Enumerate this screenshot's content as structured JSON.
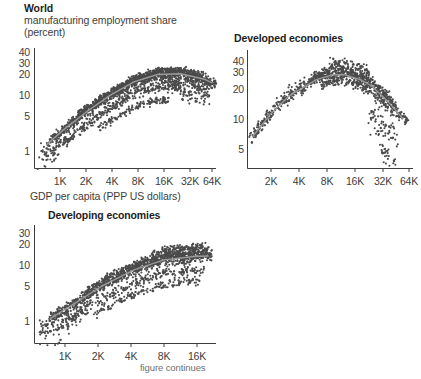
{
  "figure": {
    "footnote": "figure continues",
    "axis_title": "GDP per capita (PPP US dollars)",
    "ink_color": "#3d3d3d",
    "point_color": "#4a4a4a",
    "trend_color": "#8c8c8c"
  },
  "panels": {
    "world": {
      "title": "World",
      "subtitle_line1": "manufacturing employment share",
      "subtitle_line2": "(percent)",
      "y_ticks": [
        "40",
        "30",
        "20",
        "10",
        "5",
        "1"
      ],
      "x_ticks": [
        "1K",
        "2K",
        "4K",
        "8K",
        "16K",
        "32K",
        "64K"
      ]
    },
    "developed": {
      "title": "Developed economies",
      "y_ticks": [
        "40",
        "30",
        "20",
        "10",
        "5"
      ],
      "x_ticks": [
        "2K",
        "4K",
        "8K",
        "16K",
        "32K",
        "64K"
      ]
    },
    "developing": {
      "title": "Developing economies",
      "y_ticks": [
        "30",
        "20",
        "10",
        "5",
        "1"
      ],
      "x_ticks": [
        "1K",
        "2K",
        "4K",
        "8K",
        "16K"
      ]
    }
  },
  "chart_data": {
    "type": "scatter",
    "xlabel": "GDP per capita (PPP US dollars)",
    "ylabel": "manufacturing employment share (percent)",
    "xscale": "log",
    "yscale": "log",
    "grid": false,
    "legend": "none",
    "panels": [
      {
        "name": "World",
        "xticks": [
          1000,
          2000,
          4000,
          8000,
          16000,
          32000,
          64000
        ],
        "xticklabels": [
          "1K",
          "2K",
          "4K",
          "8K",
          "16K",
          "32K",
          "64K"
        ],
        "yticks": [
          1,
          5,
          10,
          20,
          30,
          40
        ],
        "yticklabels": [
          "1",
          "5",
          "10",
          "20",
          "30",
          "40"
        ],
        "xlim": [
          420,
          90000
        ],
        "ylim": [
          0.55,
          50
        ],
        "trend": {
          "note": "fitted quadratic in log GDP, peaking near 16K",
          "x": [
            600,
            1000,
            2000,
            4000,
            8000,
            16000,
            32000,
            64000,
            80000
          ],
          "y": [
            1.3,
            2.3,
            4.6,
            8.5,
            14.0,
            18.5,
            19.0,
            15.5,
            13.5
          ]
        },
        "cloud": {
          "note": "dense country-year scatter, inverted-U envelope with low-share trails",
          "n_points": 2100
        }
      },
      {
        "name": "Developed economies",
        "xticks": [
          2000,
          4000,
          8000,
          16000,
          32000,
          64000
        ],
        "xticklabels": [
          "2K",
          "4K",
          "8K",
          "16K",
          "32K",
          "64K"
        ],
        "yticks": [
          5,
          10,
          20,
          30,
          40
        ],
        "yticklabels": [
          "5",
          "10",
          "20",
          "30",
          "40"
        ],
        "xlim": [
          1400,
          90000
        ],
        "ylim": [
          3.0,
          50
        ],
        "trend": {
          "note": "strong inverted U, peak around 12K-16K then sharp decline",
          "x": [
            1600,
            2500,
            4000,
            8000,
            12000,
            16000,
            24000,
            32000,
            48000,
            70000
          ],
          "y": [
            6.5,
            11.0,
            17.0,
            25.0,
            28.0,
            28.0,
            25.0,
            21.5,
            15.0,
            10.0
          ]
        },
        "cloud": {
          "note": "tight band along trend, plus a steep falling tail past 32K down to ~4",
          "n_points": 950
        }
      },
      {
        "name": "Developing economies",
        "xticks": [
          1000,
          2000,
          4000,
          8000,
          16000
        ],
        "xticklabels": [
          "1K",
          "2K",
          "4K",
          "8K",
          "16K"
        ],
        "yticks": [
          1,
          5,
          10,
          20,
          30
        ],
        "yticklabels": [
          "1",
          "5",
          "10",
          "20",
          "30"
        ],
        "xlim": [
          420,
          26000
        ],
        "ylim": [
          0.55,
          40
        ],
        "trend": {
          "note": "monotonic rise flattening above 8K",
          "x": [
            600,
            1000,
            2000,
            4000,
            8000,
            16000,
            22000
          ],
          "y": [
            1.4,
            2.3,
            4.6,
            8.0,
            11.5,
            13.0,
            13.2
          ]
        },
        "cloud": {
          "note": "broad rising cloud with several lower trails",
          "n_points": 1700
        }
      }
    ]
  }
}
